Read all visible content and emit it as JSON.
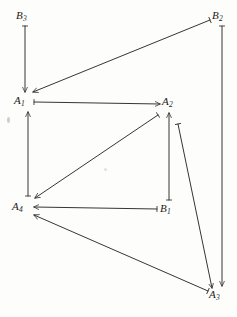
{
  "figure": {
    "width": 237,
    "height": 317,
    "background_color": "#fdfdfb",
    "ink_color": "#2a2a2a",
    "label_color": "#1a1a1a"
  },
  "nodes": [
    {
      "id": "B3",
      "base": "B",
      "sub": "3",
      "label": "B3",
      "x": 22,
      "y": 17
    },
    {
      "id": "B2",
      "base": "B",
      "sub": "2",
      "label": "B2",
      "x": 218,
      "y": 17
    },
    {
      "id": "A1",
      "base": "A",
      "sub": "1",
      "label": "A1",
      "x": 20,
      "y": 101
    },
    {
      "id": "A2",
      "base": "A",
      "sub": "2",
      "label": "A2",
      "x": 167,
      "y": 101
    },
    {
      "id": "A4",
      "base": "A",
      "sub": "4",
      "label": "A4",
      "x": 18,
      "y": 207
    },
    {
      "id": "B1",
      "base": "B",
      "sub": "1",
      "label": "B1",
      "x": 165,
      "y": 209
    },
    {
      "id": "A3",
      "base": "A",
      "sub": "3",
      "label": "A3",
      "x": 214,
      "y": 295
    }
  ],
  "edges": [
    {
      "id": "e1",
      "from": "B3",
      "to": "A1",
      "kind": "vertical-down",
      "x1": 25,
      "y1": 26,
      "x2": 25,
      "y2": 92
    },
    {
      "id": "e2",
      "from": "B2",
      "to": "A1",
      "kind": "diagonal-down-left",
      "x1": 210,
      "y1": 20,
      "x2": 33,
      "y2": 92
    },
    {
      "id": "e3",
      "from": "B2",
      "to": "A3",
      "kind": "vertical-down",
      "x1": 222,
      "y1": 26,
      "x2": 222,
      "y2": 286
    },
    {
      "id": "e4",
      "from": "A1",
      "to": "A2",
      "kind": "horizontal-right",
      "x1": 34,
      "y1": 102,
      "x2": 160,
      "y2": 104
    },
    {
      "id": "e5",
      "from": "A4",
      "to": "A1",
      "kind": "vertical-up",
      "x1": 28,
      "y1": 196,
      "x2": 28,
      "y2": 112
    },
    {
      "id": "e6",
      "from": "A2",
      "to": "A4",
      "kind": "diagonal-down-left",
      "x1": 158,
      "y1": 115,
      "x2": 35,
      "y2": 198
    },
    {
      "id": "e7",
      "from": "A2",
      "to": "A3",
      "kind": "diagonal-down-right",
      "x1": 178,
      "y1": 124,
      "x2": 212,
      "y2": 288
    },
    {
      "id": "e8",
      "from": "B1",
      "to": "A2",
      "kind": "vertical-up",
      "x1": 169,
      "y1": 200,
      "x2": 169,
      "y2": 113
    },
    {
      "id": "e9",
      "from": "B1",
      "to": "A4",
      "kind": "horizontal-left",
      "x1": 157,
      "y1": 209,
      "x2": 34,
      "y2": 207
    },
    {
      "id": "e10",
      "from": "A3",
      "to": "A4",
      "kind": "diagonal-up-left",
      "x1": 208,
      "y1": 291,
      "x2": 34,
      "y2": 215
    }
  ],
  "legend": {
    "node_count": 7,
    "edge_count": 10,
    "a_nodes": [
      "A1",
      "A2",
      "A3",
      "A4"
    ],
    "b_nodes": [
      "B1",
      "B2",
      "B3"
    ]
  }
}
